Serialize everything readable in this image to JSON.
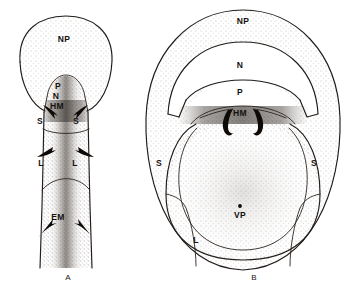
{
  "figure": {
    "title": "",
    "background_color": "#ffffff",
    "ink_color": "#211c19",
    "stipple_color": "#8d8782",
    "width": 356,
    "height": 293
  },
  "panels": [
    {
      "id": "A",
      "caption": "A",
      "caption_x": 68,
      "caption_y": 280,
      "view": "sagittal-longitudinal",
      "labels": [
        {
          "text": "NP",
          "x": 64,
          "y": 42,
          "name": "label-np-panel-a"
        },
        {
          "text": "P",
          "x": 58,
          "y": 89,
          "name": "label-p-panel-a"
        },
        {
          "text": "N",
          "x": 56,
          "y": 99,
          "name": "label-n-panel-a"
        },
        {
          "text": "HM",
          "x": 57,
          "y": 109,
          "name": "label-hm-panel-a"
        },
        {
          "text": "S",
          "x": 40,
          "y": 124,
          "name": "label-s-left-panel-a"
        },
        {
          "text": "S",
          "x": 76,
          "y": 124,
          "name": "label-s-right-panel-a"
        },
        {
          "text": "L",
          "x": 41,
          "y": 166,
          "name": "label-l-left-panel-a"
        },
        {
          "text": "L",
          "x": 75,
          "y": 166,
          "name": "label-l-right-panel-a"
        },
        {
          "text": "EM",
          "x": 58,
          "y": 220,
          "name": "label-em-panel-a"
        }
      ]
    },
    {
      "id": "B",
      "caption": "B",
      "caption_x": 254,
      "caption_y": 280,
      "view": "transverse-cross-section",
      "labels": [
        {
          "text": "NP",
          "x": 243,
          "y": 24,
          "name": "label-np-panel-b"
        },
        {
          "text": "N",
          "x": 240,
          "y": 68,
          "name": "label-n-panel-b"
        },
        {
          "text": "P",
          "x": 240,
          "y": 95,
          "name": "label-p-panel-b"
        },
        {
          "text": "HM",
          "x": 240,
          "y": 116,
          "name": "label-hm-panel-b"
        },
        {
          "text": "S",
          "x": 159,
          "y": 166,
          "name": "label-s-left-panel-b"
        },
        {
          "text": "S",
          "x": 314,
          "y": 166,
          "name": "label-s-right-panel-b"
        },
        {
          "text": "VP",
          "x": 240,
          "y": 218,
          "name": "label-vp-panel-b"
        },
        {
          "text": "L",
          "x": 196,
          "y": 243,
          "name": "label-l-panel-b"
        }
      ]
    }
  ],
  "legend_keys": {
    "NP": "NP",
    "N": "N",
    "P": "P",
    "HM": "HM",
    "S": "S",
    "L": "L",
    "EM": "EM",
    "VP": "VP"
  }
}
